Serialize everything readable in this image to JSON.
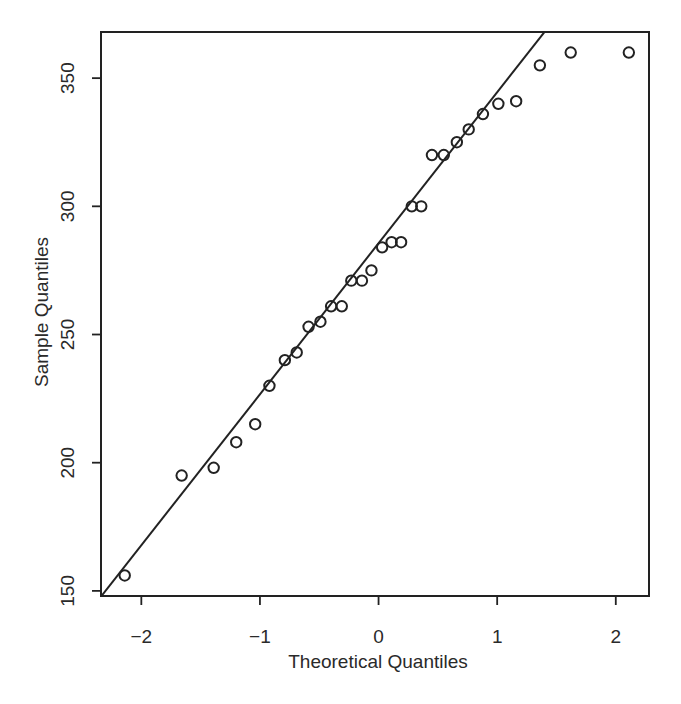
{
  "chart_data": {
    "type": "scatter",
    "title": "",
    "xlabel": "Theoretical Quantiles",
    "ylabel": "Sample Quantiles",
    "xlim": [
      -2.34,
      2.28
    ],
    "ylim": [
      148,
      368
    ],
    "xticks": [
      -2,
      -1,
      0,
      1,
      2
    ],
    "xtick_labels": [
      "−2",
      "−1",
      "0",
      "1",
      "2"
    ],
    "yticks": [
      150,
      200,
      250,
      300,
      350
    ],
    "ytick_labels": [
      "150",
      "200",
      "250",
      "300",
      "350"
    ],
    "grid": false,
    "legend": null,
    "marker": "open-circle",
    "series": [
      {
        "name": "sample",
        "x": [
          -2.14,
          -1.66,
          -1.39,
          -1.2,
          -1.04,
          -0.92,
          -0.79,
          -0.69,
          -0.59,
          -0.49,
          -0.4,
          -0.31,
          -0.23,
          -0.14,
          -0.06,
          0.03,
          0.11,
          0.19,
          0.28,
          0.36,
          0.45,
          0.55,
          0.66,
          0.76,
          0.88,
          1.01,
          1.16,
          1.36,
          1.62,
          2.11
        ],
        "y": [
          156,
          195,
          198,
          208,
          215,
          230,
          240,
          243,
          253,
          255,
          261,
          261,
          271,
          271,
          275,
          284,
          286,
          286,
          300,
          300,
          320,
          320,
          325,
          330,
          336,
          340,
          341,
          355,
          360,
          360
        ]
      }
    ],
    "reference_line": {
      "type": "qqline",
      "slope": 58.9,
      "intercept": 285.6
    }
  },
  "colors": {
    "ink": "#222222",
    "background": "#ffffff"
  }
}
